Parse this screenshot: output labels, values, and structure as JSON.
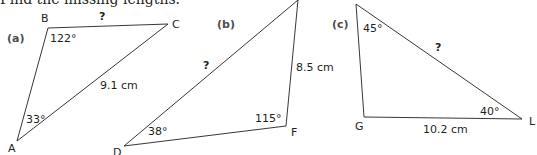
{
  "instruction": "Find the missing lengths.",
  "line_color": "#231f20",
  "triangles": [
    {
      "part": "(a)",
      "vertices": {
        "B": {
          "label": "B",
          "x": 48,
          "y": 28
        },
        "C": {
          "label": "C",
          "x": 168,
          "y": 24
        },
        "A": {
          "label": "A",
          "x": 17,
          "y": 141
        }
      },
      "angles": {
        "B": "122°",
        "A": "33°"
      },
      "sides": {
        "BC": "?",
        "AC": "9.1 cm"
      }
    },
    {
      "part": "(b)",
      "vertices": {
        "E": {
          "label": "",
          "x": 298,
          "y": 0
        },
        "F": {
          "label": "F",
          "x": 286,
          "y": 126
        },
        "D": {
          "label": "D",
          "x": 124,
          "y": 146
        }
      },
      "angles": {
        "F": "115°",
        "D": "38°"
      },
      "sides": {
        "DE": "?",
        "EF": "8.5 cm"
      }
    },
    {
      "part": "(c)",
      "vertices": {
        "K": {
          "label": "",
          "x": 356,
          "y": 4
        },
        "G": {
          "label": "G",
          "x": 364,
          "y": 117
        },
        "L": {
          "label": "L",
          "x": 522,
          "y": 119
        }
      },
      "angles": {
        "K": "45°",
        "L": "40°"
      },
      "sides": {
        "KL": "?",
        "GL": "10.2 cm"
      }
    }
  ]
}
